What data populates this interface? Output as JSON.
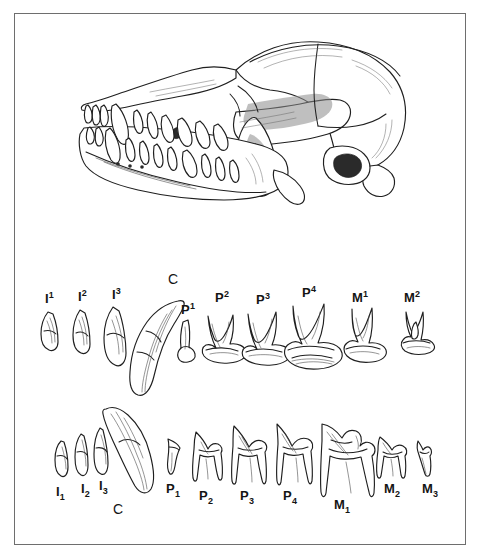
{
  "plate": {
    "kind": "scientific-illustration",
    "subject": "canid skull lateral view with upper and lower dentition",
    "background_color": "#ffffff",
    "ink_color": "#1a1a1a",
    "frame_color": "#6e6e6e"
  },
  "figures": {
    "skull": {
      "name": "skull-lateral-view"
    },
    "upper_dentition": {
      "name": "upper-tooth-row"
    },
    "lower_dentition": {
      "name": "lower-tooth-row"
    }
  },
  "upper_teeth": [
    {
      "id": "I1",
      "letter": "I",
      "index": "1",
      "position": "superscript",
      "x": 45,
      "y": 292
    },
    {
      "id": "I2",
      "letter": "I",
      "index": "2",
      "position": "superscript",
      "x": 78,
      "y": 290
    },
    {
      "id": "I3",
      "letter": "I",
      "index": "3",
      "position": "superscript",
      "x": 112,
      "y": 288
    },
    {
      "id": "C",
      "letter": "C",
      "index": "",
      "position": "none",
      "x": 168,
      "y": 272
    },
    {
      "id": "P1",
      "letter": "P",
      "index": "1",
      "position": "superscript",
      "x": 181,
      "y": 303
    },
    {
      "id": "P2",
      "letter": "P",
      "index": "2",
      "position": "superscript",
      "x": 215,
      "y": 291
    },
    {
      "id": "P3",
      "letter": "P",
      "index": "3",
      "position": "superscript",
      "x": 256,
      "y": 293
    },
    {
      "id": "P4",
      "letter": "P",
      "index": "4",
      "position": "superscript",
      "x": 302,
      "y": 286
    },
    {
      "id": "M1",
      "letter": "M",
      "index": "1",
      "position": "superscript",
      "x": 352,
      "y": 291
    },
    {
      "id": "M2",
      "letter": "M",
      "index": "2",
      "position": "superscript",
      "x": 404,
      "y": 291
    }
  ],
  "lower_teeth": [
    {
      "id": "I1",
      "letter": "I",
      "index": "1",
      "position": "subscript",
      "x": 56,
      "y": 485
    },
    {
      "id": "I2",
      "letter": "I",
      "index": "2",
      "position": "subscript",
      "x": 81,
      "y": 482
    },
    {
      "id": "I3",
      "letter": "I",
      "index": "3",
      "position": "subscript",
      "x": 99,
      "y": 479
    },
    {
      "id": "C",
      "letter": "C",
      "index": "",
      "position": "none",
      "x": 113,
      "y": 502
    },
    {
      "id": "P1",
      "letter": "P",
      "index": "1",
      "position": "subscript",
      "x": 166,
      "y": 482
    },
    {
      "id": "P2",
      "letter": "P",
      "index": "2",
      "position": "subscript",
      "x": 199,
      "y": 489
    },
    {
      "id": "P3",
      "letter": "P",
      "index": "3",
      "position": "subscript",
      "x": 240,
      "y": 489
    },
    {
      "id": "P4",
      "letter": "P",
      "index": "4",
      "position": "subscript",
      "x": 283,
      "y": 489
    },
    {
      "id": "M1",
      "letter": "M",
      "index": "1",
      "position": "subscript",
      "x": 334,
      "y": 498
    },
    {
      "id": "M2",
      "letter": "M",
      "index": "2",
      "position": "subscript",
      "x": 384,
      "y": 482
    },
    {
      "id": "M3",
      "letter": "M",
      "index": "3",
      "position": "subscript",
      "x": 422,
      "y": 482
    }
  ]
}
